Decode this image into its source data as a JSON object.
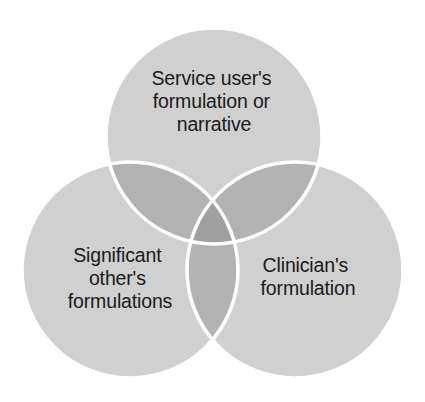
{
  "figure": {
    "type": "venn-diagram-3-set",
    "background_color": "#ffffff",
    "canvas": {
      "width": 425,
      "height": 402
    }
  },
  "style": {
    "circle_fill": "#d0d0d0",
    "pair_overlap_fill": "#b2b2b2",
    "triple_overlap_fill": "#a0a0a0",
    "outline_color": "#ffffff",
    "outline_width": 3.5,
    "text_color": "#1a1a1a"
  },
  "sets": [
    {
      "id": "service-user",
      "position": "top",
      "cx": 214,
      "cy": 136,
      "r": 108,
      "label_lines": [
        "Service user's",
        "formulation or",
        "narrative"
      ],
      "label_x": 214,
      "label_y": 85
    },
    {
      "id": "significant-other",
      "position": "bottom-left",
      "cx": 130,
      "cy": 270,
      "r": 108,
      "label_lines": [
        "Significant",
        "other's",
        "formulations"
      ],
      "label_x": 120,
      "label_y": 262
    },
    {
      "id": "clinician",
      "position": "bottom-right",
      "cx": 295,
      "cy": 270,
      "r": 108,
      "label_lines": [
        "Clinician's",
        "formulation"
      ],
      "label_x": 308,
      "label_y": 272
    }
  ]
}
